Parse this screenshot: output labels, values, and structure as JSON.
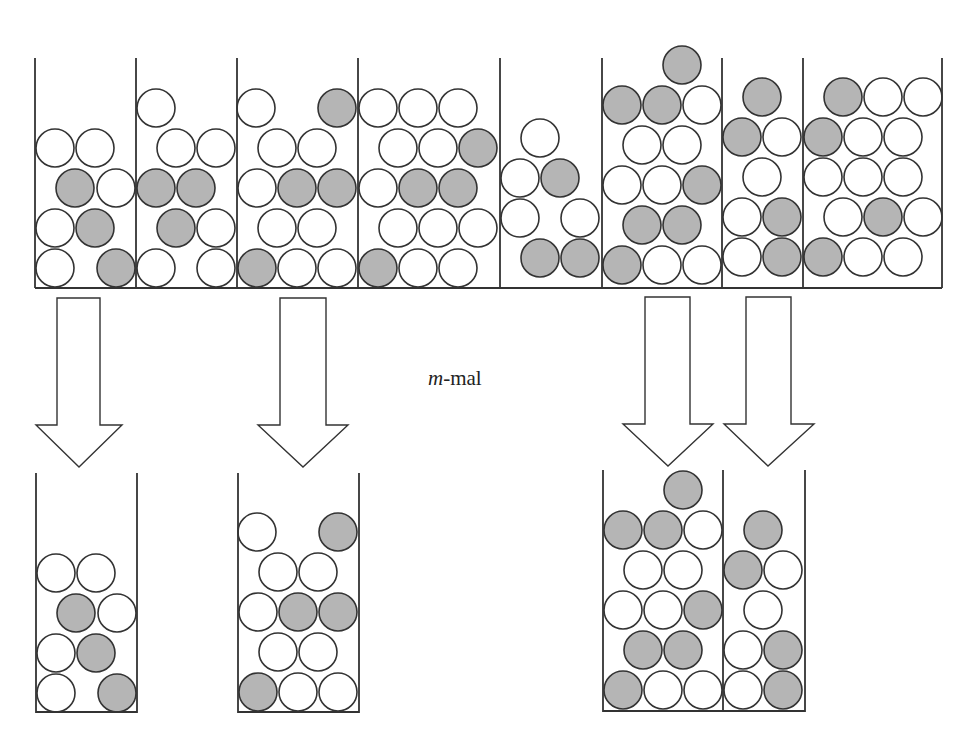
{
  "label": {
    "italic": "m",
    "rest": "-mal",
    "x": 428,
    "y": 366
  },
  "colors": {
    "stroke": "#333333",
    "gray": "#b5b5b5",
    "white": "#ffffff"
  },
  "ball_radius": 19,
  "top_row": {
    "baseline_y": 288,
    "top_y": 58,
    "left_x": 35,
    "right_x": 942,
    "dividers_x": [
      136,
      237,
      358,
      500,
      602,
      722,
      803
    ],
    "containers": [
      {
        "id": 1,
        "balls": [
          {
            "x": 55,
            "y": 268,
            "c": "w"
          },
          {
            "x": 116,
            "y": 268,
            "c": "g"
          },
          {
            "x": 55,
            "y": 228,
            "c": "w"
          },
          {
            "x": 95,
            "y": 228,
            "c": "g"
          },
          {
            "x": 75,
            "y": 188,
            "c": "g"
          },
          {
            "x": 116,
            "y": 188,
            "c": "w"
          },
          {
            "x": 55,
            "y": 148,
            "c": "w"
          },
          {
            "x": 95,
            "y": 148,
            "c": "w"
          }
        ]
      },
      {
        "id": 2,
        "balls": [
          {
            "x": 156,
            "y": 268,
            "c": "w"
          },
          {
            "x": 216,
            "y": 268,
            "c": "w"
          },
          {
            "x": 176,
            "y": 228,
            "c": "g"
          },
          {
            "x": 216,
            "y": 228,
            "c": "w"
          },
          {
            "x": 156,
            "y": 188,
            "c": "g"
          },
          {
            "x": 196,
            "y": 188,
            "c": "g"
          },
          {
            "x": 176,
            "y": 148,
            "c": "w"
          },
          {
            "x": 216,
            "y": 148,
            "c": "w"
          },
          {
            "x": 156,
            "y": 108,
            "c": "w"
          }
        ]
      },
      {
        "id": 3,
        "balls": [
          {
            "x": 257,
            "y": 268,
            "c": "g"
          },
          {
            "x": 297,
            "y": 268,
            "c": "w"
          },
          {
            "x": 337,
            "y": 268,
            "c": "w"
          },
          {
            "x": 277,
            "y": 228,
            "c": "w"
          },
          {
            "x": 317,
            "y": 228,
            "c": "w"
          },
          {
            "x": 257,
            "y": 188,
            "c": "w"
          },
          {
            "x": 297,
            "y": 188,
            "c": "g"
          },
          {
            "x": 337,
            "y": 188,
            "c": "g"
          },
          {
            "x": 277,
            "y": 148,
            "c": "w"
          },
          {
            "x": 317,
            "y": 148,
            "c": "w"
          },
          {
            "x": 256,
            "y": 108,
            "c": "w"
          },
          {
            "x": 337,
            "y": 108,
            "c": "g"
          }
        ]
      },
      {
        "id": 4,
        "balls": [
          {
            "x": 378,
            "y": 268,
            "c": "g"
          },
          {
            "x": 418,
            "y": 268,
            "c": "w"
          },
          {
            "x": 458,
            "y": 268,
            "c": "w"
          },
          {
            "x": 398,
            "y": 228,
            "c": "w"
          },
          {
            "x": 438,
            "y": 228,
            "c": "w"
          },
          {
            "x": 478,
            "y": 228,
            "c": "w"
          },
          {
            "x": 378,
            "y": 188,
            "c": "w"
          },
          {
            "x": 418,
            "y": 188,
            "c": "g"
          },
          {
            "x": 458,
            "y": 188,
            "c": "g"
          },
          {
            "x": 398,
            "y": 148,
            "c": "w"
          },
          {
            "x": 438,
            "y": 148,
            "c": "w"
          },
          {
            "x": 478,
            "y": 148,
            "c": "g"
          },
          {
            "x": 378,
            "y": 108,
            "c": "w"
          },
          {
            "x": 418,
            "y": 108,
            "c": "w"
          },
          {
            "x": 458,
            "y": 108,
            "c": "w"
          }
        ]
      },
      {
        "id": 5,
        "balls": [
          {
            "x": 540,
            "y": 258,
            "c": "g"
          },
          {
            "x": 580,
            "y": 258,
            "c": "g"
          },
          {
            "x": 520,
            "y": 218,
            "c": "w"
          },
          {
            "x": 580,
            "y": 218,
            "c": "w"
          },
          {
            "x": 520,
            "y": 178,
            "c": "w"
          },
          {
            "x": 560,
            "y": 178,
            "c": "g"
          },
          {
            "x": 540,
            "y": 138,
            "c": "w"
          }
        ]
      },
      {
        "id": 6,
        "balls": [
          {
            "x": 622,
            "y": 265,
            "c": "g"
          },
          {
            "x": 662,
            "y": 265,
            "c": "w"
          },
          {
            "x": 702,
            "y": 265,
            "c": "w"
          },
          {
            "x": 642,
            "y": 225,
            "c": "g"
          },
          {
            "x": 682,
            "y": 225,
            "c": "g"
          },
          {
            "x": 622,
            "y": 185,
            "c": "w"
          },
          {
            "x": 662,
            "y": 185,
            "c": "w"
          },
          {
            "x": 702,
            "y": 185,
            "c": "g"
          },
          {
            "x": 642,
            "y": 145,
            "c": "w"
          },
          {
            "x": 682,
            "y": 145,
            "c": "w"
          },
          {
            "x": 622,
            "y": 105,
            "c": "g"
          },
          {
            "x": 662,
            "y": 105,
            "c": "g"
          },
          {
            "x": 702,
            "y": 105,
            "c": "w"
          },
          {
            "x": 682,
            "y": 65,
            "c": "g"
          }
        ]
      },
      {
        "id": 7,
        "balls": [
          {
            "x": 742,
            "y": 257,
            "c": "w"
          },
          {
            "x": 782,
            "y": 257,
            "c": "g"
          },
          {
            "x": 742,
            "y": 217,
            "c": "w"
          },
          {
            "x": 782,
            "y": 217,
            "c": "g"
          },
          {
            "x": 762,
            "y": 177,
            "c": "w"
          },
          {
            "x": 742,
            "y": 137,
            "c": "g"
          },
          {
            "x": 782,
            "y": 137,
            "c": "w"
          },
          {
            "x": 762,
            "y": 97,
            "c": "g"
          }
        ]
      },
      {
        "id": 8,
        "balls": [
          {
            "x": 823,
            "y": 257,
            "c": "g"
          },
          {
            "x": 863,
            "y": 257,
            "c": "w"
          },
          {
            "x": 903,
            "y": 257,
            "c": "w"
          },
          {
            "x": 843,
            "y": 217,
            "c": "w"
          },
          {
            "x": 883,
            "y": 217,
            "c": "g"
          },
          {
            "x": 923,
            "y": 217,
            "c": "w"
          },
          {
            "x": 823,
            "y": 177,
            "c": "w"
          },
          {
            "x": 863,
            "y": 177,
            "c": "w"
          },
          {
            "x": 903,
            "y": 177,
            "c": "w"
          },
          {
            "x": 823,
            "y": 137,
            "c": "g"
          },
          {
            "x": 863,
            "y": 137,
            "c": "w"
          },
          {
            "x": 903,
            "y": 137,
            "c": "w"
          },
          {
            "x": 843,
            "y": 97,
            "c": "g"
          },
          {
            "x": 883,
            "y": 97,
            "c": "w"
          },
          {
            "x": 923,
            "y": 97,
            "c": "w"
          }
        ]
      }
    ]
  },
  "arrows": [
    {
      "id": "arrow-1",
      "shaft_left": 57,
      "shaft_right": 100,
      "top": 298,
      "shaft_bottom": 425,
      "head_left": 36,
      "head_right": 122,
      "tip_x": 79,
      "tip_y": 467
    },
    {
      "id": "arrow-2",
      "shaft_left": 280,
      "shaft_right": 326,
      "top": 298,
      "shaft_bottom": 425,
      "head_left": 258,
      "head_right": 348,
      "tip_x": 303,
      "tip_y": 467
    },
    {
      "id": "arrow-3",
      "shaft_left": 645,
      "shaft_right": 690,
      "top": 297,
      "shaft_bottom": 424,
      "head_left": 623,
      "head_right": 713,
      "tip_x": 668,
      "tip_y": 466
    },
    {
      "id": "arrow-4",
      "shaft_left": 746,
      "shaft_right": 791,
      "top": 297,
      "shaft_bottom": 424,
      "head_left": 724,
      "head_right": 814,
      "tip_x": 768,
      "tip_y": 466
    }
  ],
  "bottom_row": {
    "containers": [
      {
        "id": "b1",
        "left": 36,
        "right": 137,
        "top": 473,
        "bottom": 712,
        "dividers_x": [],
        "balls": [
          {
            "x": 56,
            "y": 693,
            "c": "w"
          },
          {
            "x": 117,
            "y": 693,
            "c": "g"
          },
          {
            "x": 56,
            "y": 653,
            "c": "w"
          },
          {
            "x": 96,
            "y": 653,
            "c": "g"
          },
          {
            "x": 76,
            "y": 613,
            "c": "g"
          },
          {
            "x": 117,
            "y": 613,
            "c": "w"
          },
          {
            "x": 56,
            "y": 573,
            "c": "w"
          },
          {
            "x": 96,
            "y": 573,
            "c": "w"
          }
        ]
      },
      {
        "id": "b2",
        "left": 238,
        "right": 359,
        "top": 473,
        "bottom": 712,
        "dividers_x": [],
        "balls": [
          {
            "x": 258,
            "y": 692,
            "c": "g"
          },
          {
            "x": 298,
            "y": 692,
            "c": "w"
          },
          {
            "x": 338,
            "y": 692,
            "c": "w"
          },
          {
            "x": 278,
            "y": 652,
            "c": "w"
          },
          {
            "x": 318,
            "y": 652,
            "c": "w"
          },
          {
            "x": 258,
            "y": 612,
            "c": "w"
          },
          {
            "x": 298,
            "y": 612,
            "c": "g"
          },
          {
            "x": 338,
            "y": 612,
            "c": "g"
          },
          {
            "x": 278,
            "y": 572,
            "c": "w"
          },
          {
            "x": 318,
            "y": 572,
            "c": "w"
          },
          {
            "x": 257,
            "y": 532,
            "c": "w"
          },
          {
            "x": 338,
            "y": 532,
            "c": "g"
          }
        ]
      },
      {
        "id": "b3",
        "left": 603,
        "right": 805,
        "top": 470,
        "bottom": 711,
        "dividers_x": [
          723
        ],
        "balls": [
          {
            "x": 623,
            "y": 690,
            "c": "g"
          },
          {
            "x": 663,
            "y": 690,
            "c": "w"
          },
          {
            "x": 703,
            "y": 690,
            "c": "w"
          },
          {
            "x": 643,
            "y": 650,
            "c": "g"
          },
          {
            "x": 683,
            "y": 650,
            "c": "g"
          },
          {
            "x": 623,
            "y": 610,
            "c": "w"
          },
          {
            "x": 663,
            "y": 610,
            "c": "w"
          },
          {
            "x": 703,
            "y": 610,
            "c": "g"
          },
          {
            "x": 643,
            "y": 570,
            "c": "w"
          },
          {
            "x": 683,
            "y": 570,
            "c": "w"
          },
          {
            "x": 623,
            "y": 530,
            "c": "g"
          },
          {
            "x": 663,
            "y": 530,
            "c": "g"
          },
          {
            "x": 703,
            "y": 530,
            "c": "w"
          },
          {
            "x": 683,
            "y": 490,
            "c": "g"
          },
          {
            "x": 743,
            "y": 690,
            "c": "w"
          },
          {
            "x": 783,
            "y": 690,
            "c": "g"
          },
          {
            "x": 743,
            "y": 650,
            "c": "w"
          },
          {
            "x": 783,
            "y": 650,
            "c": "g"
          },
          {
            "x": 763,
            "y": 610,
            "c": "w"
          },
          {
            "x": 743,
            "y": 570,
            "c": "g"
          },
          {
            "x": 783,
            "y": 570,
            "c": "w"
          },
          {
            "x": 763,
            "y": 530,
            "c": "g"
          }
        ]
      }
    ]
  }
}
